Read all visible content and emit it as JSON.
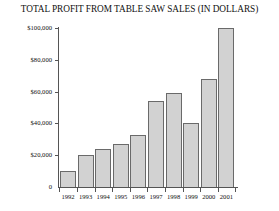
{
  "chart_data": {
    "type": "bar",
    "title": "TOTAL PROFIT FROM TABLE SAW SALES (IN DOLLARS)",
    "xlabel": "",
    "ylabel": "",
    "categories": [
      "1992",
      "1993",
      "1994",
      "1995",
      "1996",
      "1997",
      "1998",
      "1999",
      "2000",
      "2001"
    ],
    "values": [
      10000,
      20000,
      24000,
      27000,
      33000,
      54000,
      59000,
      40000,
      68000,
      100000
    ],
    "ylim": [
      0,
      100000
    ],
    "ytick_values": [
      0,
      20000,
      40000,
      60000,
      80000,
      100000
    ],
    "ytick_labels": [
      "0",
      "$20,000",
      "$40,000",
      "$60,000",
      "$80,000",
      "$100,000"
    ],
    "grid": false,
    "legend": null,
    "bar_color": "#d2d2d2",
    "bar_edge_color": "#6a6a6a",
    "axis_color": "#555555",
    "background_color": "#ffffff"
  }
}
